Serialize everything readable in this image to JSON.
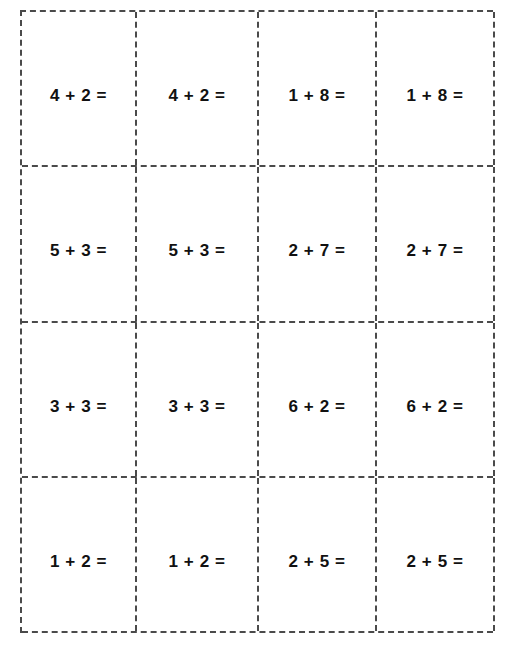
{
  "worksheet": {
    "kind": "addition-flashcard-cutout-sheet",
    "columns": 4,
    "rows": 4,
    "border_color": "#4a4a4a",
    "text_color": "#111111",
    "background_color": "#ffffff",
    "cards": [
      [
        {
          "problem": "4 + 2 =",
          "left": "4",
          "operator": "+",
          "right": "2",
          "equals": "="
        },
        {
          "problem": "4 + 2 =",
          "left": "4",
          "operator": "+",
          "right": "2",
          "equals": "="
        },
        {
          "problem": "1 + 8 =",
          "left": "1",
          "operator": "+",
          "right": "8",
          "equals": "="
        },
        {
          "problem": "1 + 8 =",
          "left": "1",
          "operator": "+",
          "right": "8",
          "equals": "="
        }
      ],
      [
        {
          "problem": "5 + 3 =",
          "left": "5",
          "operator": "+",
          "right": "3",
          "equals": "="
        },
        {
          "problem": "5 + 3 =",
          "left": "5",
          "operator": "+",
          "right": "3",
          "equals": "="
        },
        {
          "problem": "2 + 7 =",
          "left": "2",
          "operator": "+",
          "right": "7",
          "equals": "="
        },
        {
          "problem": "2 + 7 =",
          "left": "2",
          "operator": "+",
          "right": "7",
          "equals": "="
        }
      ],
      [
        {
          "problem": "3 + 3 =",
          "left": "3",
          "operator": "+",
          "right": "3",
          "equals": "="
        },
        {
          "problem": "3 + 3 =",
          "left": "3",
          "operator": "+",
          "right": "3",
          "equals": "="
        },
        {
          "problem": "6 + 2 =",
          "left": "6",
          "operator": "+",
          "right": "2",
          "equals": "="
        },
        {
          "problem": "6 + 2 =",
          "left": "6",
          "operator": "+",
          "right": "2",
          "equals": "="
        }
      ],
      [
        {
          "problem": "1 + 2 =",
          "left": "1",
          "operator": "+",
          "right": "2",
          "equals": "="
        },
        {
          "problem": "1 + 2 =",
          "left": "1",
          "operator": "+",
          "right": "2",
          "equals": "="
        },
        {
          "problem": "2 + 5 =",
          "left": "2",
          "operator": "+",
          "right": "5",
          "equals": "="
        },
        {
          "problem": "2 + 5 =",
          "left": "2",
          "operator": "+",
          "right": "5",
          "equals": "="
        }
      ]
    ]
  }
}
